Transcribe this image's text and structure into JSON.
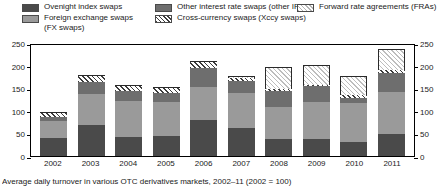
{
  "legend": {
    "items": [
      {
        "key": "ois",
        "label": "Ovenight index swaps",
        "label2": "",
        "swatch": "solid-dark-gray-swatch"
      },
      {
        "key": "fx",
        "label": "Foreign exchange swaps",
        "label2": "(FX swaps)",
        "swatch": "solid-light-gray-swatch"
      },
      {
        "key": "irs",
        "label": "Other interest rate swaps (other IRSs)",
        "label2": "",
        "swatch": "solid-medium-gray-swatch"
      },
      {
        "key": "xccy",
        "label": "Cross-currency swaps (Xccy swaps)",
        "label2": "",
        "swatch": "dense-diagonal-hatch-swatch"
      },
      {
        "key": "fra",
        "label": "Forward rate agreements (FRAs)",
        "label2": "",
        "swatch": "light-diagonal-hatch-swatch"
      }
    ]
  },
  "caption": "Average daily turnover in various OTC derivatives markets, 2002–11 (2002 = 100)",
  "colors": {
    "ois": "#4a4a4a",
    "fx": "#9a9a9a",
    "irs": "#6e6e6e",
    "xccy": "#3c3c3c",
    "fra": "#bdbdbd",
    "axis": "#000000"
  },
  "chart_data": {
    "type": "bar",
    "stacked": true,
    "title": "Average daily turnover in various OTC derivatives markets, 2002–11 (2002 = 100)",
    "xlabel": "",
    "ylabel": "",
    "ylim": [
      0,
      250
    ],
    "yticks": [
      0,
      50,
      100,
      150,
      200,
      250
    ],
    "grid": false,
    "legend_position": "top",
    "dual_y_axis": true,
    "categories": [
      "2002",
      "2003",
      "2004",
      "2005",
      "2006",
      "2007",
      "2008",
      "2009",
      "2010",
      "2011"
    ],
    "series": [
      {
        "name": "Ovenight index swaps",
        "values": [
          40,
          68,
          42,
          45,
          80,
          62,
          38,
          37,
          31,
          49
        ]
      },
      {
        "name": "Foreign exchange swaps (FX swaps)",
        "values": [
          37,
          70,
          80,
          75,
          72,
          78,
          70,
          83,
          86,
          92
        ]
      },
      {
        "name": "Other interest rate swaps (other IRSs)",
        "values": [
          10,
          26,
          22,
          20,
          43,
          25,
          35,
          34,
          12,
          42
        ]
      },
      {
        "name": "Cross-currency swaps (Xccy swaps)",
        "values": [
          8,
          13,
          10,
          10,
          13,
          8,
          5,
          4,
          5,
          7
        ]
      },
      {
        "name": "Forward rate agreements (FRAs)",
        "values": [
          2,
          3,
          2,
          2,
          3,
          4,
          49,
          44,
          44,
          47
        ]
      }
    ],
    "totals": [
      97,
      180,
      156,
      152,
      211,
      177,
      197,
      202,
      178,
      237
    ]
  }
}
